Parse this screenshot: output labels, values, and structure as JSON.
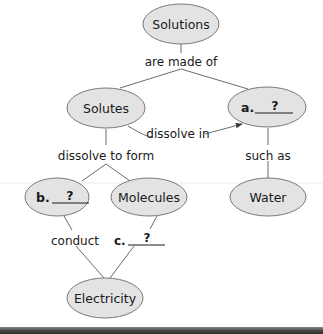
{
  "concept_map": {
    "nodes": {
      "solutions": {
        "label": "Solutions"
      },
      "solutes": {
        "label": "Solutes"
      },
      "a": {
        "prefix": "a.",
        "blank": "?"
      },
      "b": {
        "prefix": "b.",
        "blank": "?"
      },
      "molecules": {
        "label": "Molecules"
      },
      "water": {
        "label": "Water"
      },
      "electricity": {
        "label": "Electricity"
      }
    },
    "links": {
      "are_made_of": "are made of",
      "dissolve_in": "dissolve in",
      "dissolve_to_form": "dissolve to form",
      "such_as": "such as",
      "conduct": "conduct",
      "c_prefix": "c.",
      "c_blank": "?"
    }
  },
  "colors": {
    "node_fill": "#e3e3e3",
    "node_stroke": "#7a7a7a",
    "bottom_bar": "#4a4a4a"
  }
}
